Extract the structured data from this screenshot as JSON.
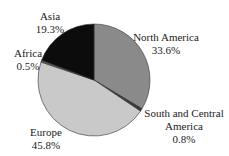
{
  "chart_data": {
    "type": "pie",
    "title": "",
    "categories": [
      "North America",
      "South and Central America",
      "Europe",
      "Africa",
      "Asia"
    ],
    "values": [
      33.6,
      0.8,
      45.8,
      0.5,
      19.3
    ],
    "unit": "%",
    "colors": [
      "#8a8a8a",
      "#3a3a3a",
      "#c9c9c9",
      "#6a6a6a",
      "#0c0c0c"
    ],
    "start_angle_deg": 0,
    "direction": "clockwise",
    "legend": "none (direct labels)"
  },
  "labels": [
    {
      "name": "North America",
      "value": "33.6%"
    },
    {
      "name": "South and Central",
      "name2": "America",
      "value": "0.8%"
    },
    {
      "name": "Europe",
      "value": "45.8%"
    },
    {
      "name": "Africa",
      "value": "0.5%"
    },
    {
      "name": "Asia",
      "value": "19.3%"
    }
  ]
}
